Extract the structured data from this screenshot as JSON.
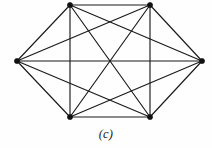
{
  "figure": {
    "caption": "(c)",
    "label_type": "sub-figure-letter",
    "canvas": {
      "width": 212,
      "height": 148
    },
    "background_color": "#fefefe"
  },
  "chart_data": {
    "type": "diagram",
    "diagram_kind": "graph",
    "title": "(c)",
    "graph_name": "K6",
    "vertex_count": 6,
    "edge_count": 15,
    "is_complete": true,
    "degree_per_vertex": 6,
    "vertex_style": {
      "shape": "circle",
      "radius": 2.6,
      "color": "#111111"
    },
    "edge_style": {
      "color": "#1a1a1a",
      "width": 1.15
    },
    "vertices": [
      {
        "id": "v1",
        "label": "",
        "x": 70,
        "y": 5
      },
      {
        "id": "v2",
        "label": "",
        "x": 150,
        "y": 5
      },
      {
        "id": "v3",
        "label": "",
        "x": 202,
        "y": 61
      },
      {
        "id": "v4",
        "label": "",
        "x": 150,
        "y": 117
      },
      {
        "id": "v5",
        "label": "",
        "x": 70,
        "y": 117
      },
      {
        "id": "v6",
        "label": "",
        "x": 17,
        "y": 61
      }
    ],
    "edges": [
      {
        "from": "v1",
        "to": "v2"
      },
      {
        "from": "v1",
        "to": "v3"
      },
      {
        "from": "v1",
        "to": "v4"
      },
      {
        "from": "v1",
        "to": "v5"
      },
      {
        "from": "v1",
        "to": "v6"
      },
      {
        "from": "v2",
        "to": "v3"
      },
      {
        "from": "v2",
        "to": "v4"
      },
      {
        "from": "v2",
        "to": "v5"
      },
      {
        "from": "v2",
        "to": "v6"
      },
      {
        "from": "v3",
        "to": "v4"
      },
      {
        "from": "v3",
        "to": "v5"
      },
      {
        "from": "v3",
        "to": "v6"
      },
      {
        "from": "v4",
        "to": "v5"
      },
      {
        "from": "v4",
        "to": "v6"
      },
      {
        "from": "v5",
        "to": "v6"
      }
    ]
  }
}
